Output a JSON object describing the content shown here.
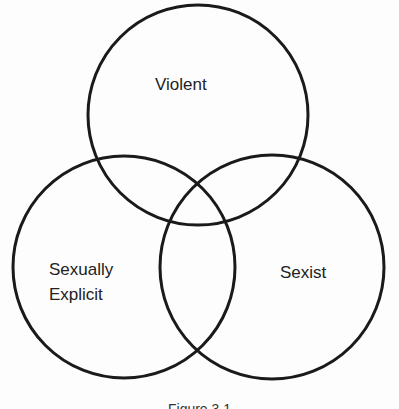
{
  "diagram": {
    "type": "venn",
    "sets": [
      {
        "id": "violent",
        "label": "Violent"
      },
      {
        "id": "sexually-explicit",
        "label_lines": [
          "Sexually",
          "Explicit"
        ]
      },
      {
        "id": "sexist",
        "label": "Sexist"
      }
    ],
    "caption": "Figure 3.1"
  }
}
